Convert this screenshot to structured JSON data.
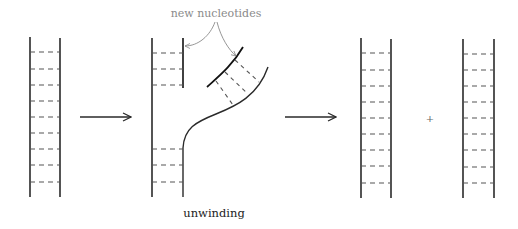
{
  "diagram": {
    "labels": {
      "new_nucleotides": "new nucleotides",
      "unwinding": "unwinding",
      "plus": "+"
    },
    "stages": [
      {
        "name": "parent-double-helix",
        "rungs": 9
      },
      {
        "name": "replication-fork",
        "description": "unwinding with new nucleotides added"
      },
      {
        "name": "daughter-double-helix-1",
        "rungs": 9
      },
      {
        "name": "daughter-double-helix-2",
        "rungs": 9
      }
    ],
    "colors": {
      "strand": "#2a2a2a",
      "new_strand": "#111111",
      "rung": "#555555",
      "annotation": "#8a8a8a"
    }
  }
}
